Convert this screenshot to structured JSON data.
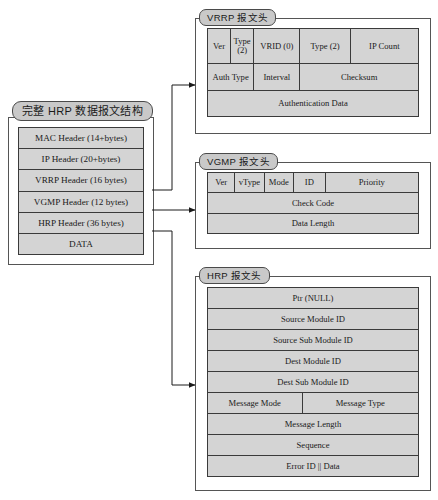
{
  "diagram": {
    "background": "#ffffff",
    "cell_fill": "#d4d4d4",
    "tab_fill": "#c9c9c9",
    "border_color": "#3a3a3a"
  },
  "stack": {
    "title": "完整 HRP 数据报文结构",
    "rows": [
      {
        "label": "MAC Header (14+bytes)"
      },
      {
        "label": "IP Header (20+bytes)"
      },
      {
        "label": "VRRP Header (16 bytes)"
      },
      {
        "label": "VGMP Header (12 bytes)"
      },
      {
        "label": "HRP Header (36 bytes)"
      },
      {
        "label": "DATA"
      }
    ]
  },
  "vrrp": {
    "title": "VRRP 报文头",
    "rows": [
      {
        "cells": [
          {
            "label": "Ver",
            "width": 11
          },
          {
            "label": "Type\n(2)",
            "width": 11
          },
          {
            "label": "VRID (0)",
            "width": 22
          },
          {
            "label": "Type (2)",
            "width": 24
          },
          {
            "label": "IP Count",
            "width": 32
          }
        ]
      },
      {
        "cells": [
          {
            "label": "Auth Type",
            "width": 22
          },
          {
            "label": "Interval",
            "width": 22
          },
          {
            "label": "Checksum",
            "width": 56
          }
        ]
      },
      {
        "cells": [
          {
            "label": "Authentication Data",
            "width": 100
          }
        ]
      }
    ]
  },
  "vgmp": {
    "title": "VGMP 报文头",
    "rows": [
      {
        "cells": [
          {
            "label": "Ver",
            "width": 13
          },
          {
            "label": "vType",
            "width": 14
          },
          {
            "label": "Mode",
            "width": 14
          },
          {
            "label": "ID",
            "width": 15
          },
          {
            "label": "Priority",
            "width": 44
          }
        ]
      },
      {
        "cells": [
          {
            "label": "Check Code",
            "width": 100
          }
        ]
      },
      {
        "cells": [
          {
            "label": "Data Length",
            "width": 100
          }
        ]
      }
    ]
  },
  "hrp": {
    "title": "HRP 报文头",
    "rows": [
      {
        "cells": [
          {
            "label": "Ptr (NULL)",
            "width": 100
          }
        ]
      },
      {
        "cells": [
          {
            "label": "Source Module ID",
            "width": 100
          }
        ]
      },
      {
        "cells": [
          {
            "label": "Source Sub Module ID",
            "width": 100
          }
        ]
      },
      {
        "cells": [
          {
            "label": "Dest Module ID",
            "width": 100
          }
        ]
      },
      {
        "cells": [
          {
            "label": "Dest Sub Module ID",
            "width": 100
          }
        ]
      },
      {
        "cells": [
          {
            "label": "Message Mode",
            "width": 45
          },
          {
            "label": "Message Type",
            "width": 55
          }
        ]
      },
      {
        "cells": [
          {
            "label": "Message Length",
            "width": 100
          }
        ]
      },
      {
        "cells": [
          {
            "label": "Sequence",
            "width": 100
          }
        ]
      },
      {
        "cells": [
          {
            "label": "Error ID || Data",
            "width": 100
          }
        ]
      }
    ]
  }
}
